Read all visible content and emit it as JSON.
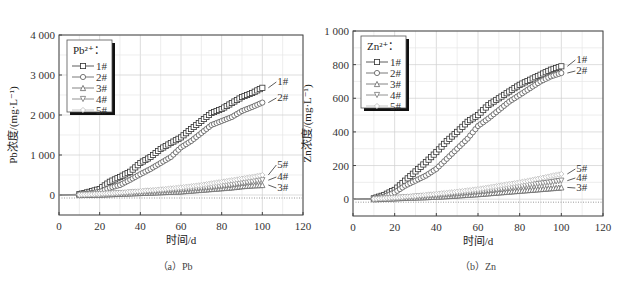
{
  "chart_data": [
    {
      "type": "line",
      "panel": "(a) Pb",
      "caption": "（a）Pb",
      "xlabel": "时间/d",
      "ylabel": "Pb浓度/(mg·L⁻¹)",
      "xlim": [
        0,
        120
      ],
      "ylim": [
        -500,
        4000
      ],
      "xticks": [
        0,
        20,
        40,
        60,
        80,
        100,
        120
      ],
      "yticks": [
        0,
        1000,
        2000,
        3000,
        4000
      ],
      "ytick_labels": [
        "0",
        "1 000",
        "2 000",
        "3 000",
        "4 000"
      ],
      "grid": true,
      "legend_title": "Pb²⁺：",
      "legend_position": "upper-left",
      "x": [
        0,
        10,
        15,
        20,
        25,
        30,
        35,
        40,
        45,
        50,
        55,
        60,
        65,
        70,
        75,
        80,
        85,
        90,
        95,
        100
      ],
      "series": [
        {
          "name": "1#",
          "marker": "square",
          "values": [
            0,
            20,
            80,
            150,
            330,
            450,
            580,
            800,
            950,
            1150,
            1300,
            1440,
            1650,
            1850,
            2050,
            2150,
            2300,
            2450,
            2550,
            2680
          ]
        },
        {
          "name": "2#",
          "marker": "circle",
          "values": [
            0,
            10,
            40,
            80,
            180,
            250,
            380,
            520,
            650,
            800,
            950,
            1190,
            1350,
            1550,
            1750,
            1850,
            1950,
            2100,
            2200,
            2310
          ]
        },
        {
          "name": "3#",
          "marker": "triangle-up",
          "values": [
            0,
            0,
            5,
            10,
            20,
            30,
            40,
            50,
            60,
            70,
            80,
            90,
            110,
            130,
            150,
            170,
            190,
            220,
            240,
            250
          ]
        },
        {
          "name": "4#",
          "marker": "triangle-down",
          "values": [
            0,
            0,
            10,
            20,
            30,
            40,
            55,
            70,
            85,
            100,
            115,
            130,
            150,
            170,
            190,
            220,
            250,
            290,
            330,
            370
          ]
        },
        {
          "name": "5#",
          "marker": "diamond",
          "values": [
            0,
            5,
            15,
            30,
            45,
            60,
            80,
            100,
            120,
            140,
            165,
            190,
            220,
            250,
            290,
            330,
            370,
            410,
            450,
            500
          ]
        }
      ],
      "annotations": [
        "1#",
        "2#",
        "5#",
        "4#",
        "3#"
      ]
    },
    {
      "type": "line",
      "panel": "(b) Zn",
      "caption": "（b）Zn",
      "xlabel": "时间/d",
      "ylabel": "Zn浓度/(mg·L⁻¹)",
      "xlim": [
        0,
        120
      ],
      "ylim": [
        -100,
        1000
      ],
      "xticks": [
        0,
        20,
        40,
        60,
        80,
        100,
        120
      ],
      "yticks": [
        0,
        200,
        400,
        600,
        800,
        1000
      ],
      "ytick_labels": [
        "0",
        "200",
        "400",
        "600",
        "800",
        "1 000"
      ],
      "grid": true,
      "legend_title": "Zn²⁺：",
      "legend_position": "upper-left",
      "x": [
        0,
        10,
        15,
        20,
        25,
        30,
        35,
        40,
        45,
        50,
        55,
        60,
        65,
        70,
        75,
        80,
        85,
        90,
        95,
        100
      ],
      "series": [
        {
          "name": "1#",
          "marker": "square",
          "values": [
            0,
            5,
            25,
            55,
            110,
            165,
            220,
            280,
            345,
            400,
            460,
            500,
            560,
            600,
            640,
            680,
            710,
            740,
            770,
            790
          ]
        },
        {
          "name": "2#",
          "marker": "circle",
          "values": [
            0,
            3,
            15,
            40,
            80,
            110,
            140,
            180,
            240,
            300,
            360,
            435,
            480,
            530,
            580,
            620,
            660,
            700,
            730,
            750
          ]
        },
        {
          "name": "3#",
          "marker": "triangle-up",
          "values": [
            0,
            0,
            2,
            5,
            8,
            10,
            12,
            15,
            18,
            22,
            26,
            30,
            35,
            40,
            45,
            50,
            55,
            60,
            65,
            70
          ]
        },
        {
          "name": "4#",
          "marker": "triangle-down",
          "values": [
            0,
            0,
            3,
            6,
            10,
            14,
            18,
            22,
            27,
            32,
            38,
            44,
            50,
            58,
            66,
            75,
            84,
            92,
            100,
            110
          ]
        },
        {
          "name": "5#",
          "marker": "diamond",
          "values": [
            0,
            2,
            6,
            10,
            15,
            20,
            26,
            32,
            38,
            45,
            52,
            60,
            70,
            80,
            90,
            100,
            112,
            125,
            138,
            150
          ]
        }
      ],
      "annotations": [
        "1#",
        "2#",
        "5#",
        "4#",
        "3#"
      ]
    }
  ]
}
